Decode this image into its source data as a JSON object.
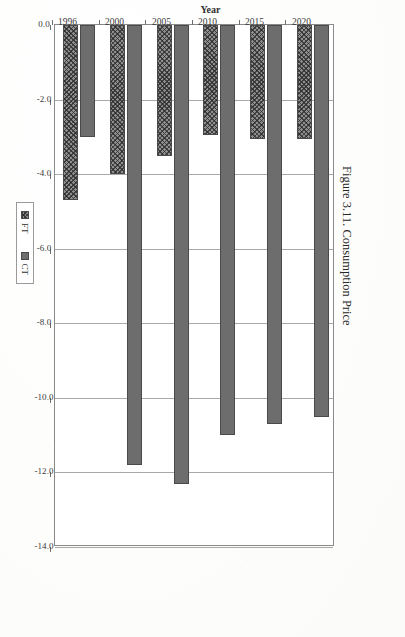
{
  "caption": {
    "label": "Figure 3.11.",
    "title": "Consumption Price",
    "full": "Figure 3.11.  Consumption Price"
  },
  "legend": {
    "position": "bottom-center",
    "entries": [
      {
        "name": "FT",
        "pattern": "crosshatch",
        "color": "#8f8f8f"
      },
      {
        "name": "CT",
        "pattern": "solid",
        "color": "#6d6d6d"
      }
    ]
  },
  "axes": {
    "category_title": "Year",
    "category_ticks": [
      "2020",
      "2015",
      "2010",
      "2005",
      "2000",
      "1996"
    ],
    "value_ticks": [
      "0.0",
      "-2.0",
      "-4.0",
      "-6.0",
      "-8.0",
      "-10.0",
      "-12.0",
      "-14.0"
    ],
    "value_tick_numbers": [
      0.0,
      2.0,
      4.0,
      6.0,
      8.0,
      10.0,
      12.0,
      14.0
    ],
    "value_min": 0.0,
    "value_max": 14.0,
    "value_step": 2.0
  },
  "chart_data": {
    "type": "bar",
    "orientation": "horizontal",
    "title": "Consumption Price",
    "xlabel": "",
    "ylabel": "Year",
    "categories": [
      "2020",
      "2015",
      "2010",
      "2005",
      "2000",
      "1996"
    ],
    "series": [
      {
        "name": "CT",
        "values": [
          10.5,
          10.7,
          11.0,
          12.3,
          11.8,
          3.0
        ]
      },
      {
        "name": "FT",
        "values": [
          3.05,
          3.05,
          2.95,
          3.5,
          4.0,
          4.7
        ]
      }
    ],
    "xlim": [
      0.0,
      14.0
    ],
    "xticks": [
      0.0,
      2.0,
      4.0,
      6.0,
      8.0,
      10.0,
      12.0,
      14.0
    ],
    "xticklabels": [
      "0.0",
      "-2.0",
      "-4.0",
      "-6.0",
      "-8.0",
      "-10.0",
      "-12.0",
      "-14.0"
    ],
    "grid": true,
    "legend": [
      "FT",
      "CT"
    ],
    "legend_position": "bottom-center"
  }
}
